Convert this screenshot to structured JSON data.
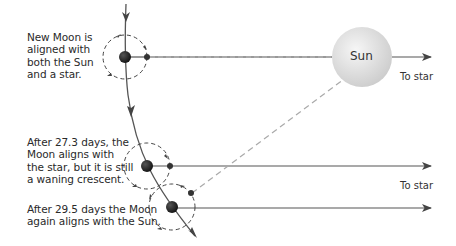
{
  "diagram": {
    "captions": [
      {
        "id": "new-moon",
        "lines": [
          "New Moon is",
          "aligned with",
          "both the Sun",
          "and a star."
        ]
      },
      {
        "id": "sidereal",
        "lines": [
          "After 27.3 days, the",
          "Moon aligns with",
          "the star, but it is still",
          "a waning crescent."
        ]
      },
      {
        "id": "synodic",
        "lines": [
          "After 29.5 days the Moon",
          "again aligns with the Sun."
        ]
      }
    ],
    "sun_label": "Sun",
    "star_labels": [
      "To star",
      "To star"
    ],
    "colors": {
      "line": "#555555",
      "dashed": "#aaaaaa",
      "earth": "#1a1a1a",
      "sun_light": "#f4f4f4",
      "sun_dark": "#cfcfcf"
    }
  }
}
